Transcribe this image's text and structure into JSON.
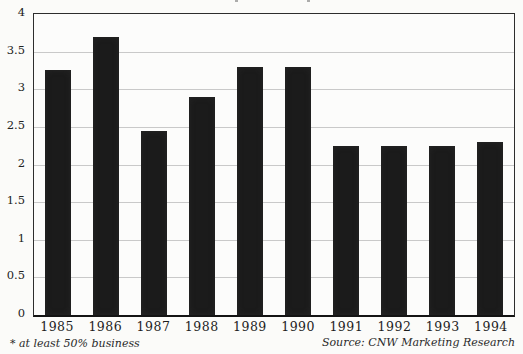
{
  "chart_data": {
    "type": "bar",
    "categories": [
      "1985",
      "1986",
      "1987",
      "1988",
      "1989",
      "1990",
      "1991",
      "1992",
      "1993",
      "1994"
    ],
    "values": [
      3.25,
      3.7,
      2.45,
      2.9,
      3.3,
      3.3,
      2.25,
      2.25,
      2.25,
      2.3
    ],
    "title": "",
    "xlabel": "",
    "ylabel": "",
    "ylim": [
      0,
      4
    ],
    "yticks": [
      0,
      0.5,
      1,
      1.5,
      2,
      2.5,
      3,
      3.5,
      4
    ],
    "ytick_labels": [
      "0",
      "0.5",
      "1",
      "1.5",
      "2",
      "2.5",
      "3",
      "3.5",
      "4"
    ],
    "grid": true,
    "legend": "none",
    "bar_color": "#1b1b1b",
    "gridline_color": "#c9c9c9",
    "frame_color": "#2d2d2d"
  },
  "footnote": "* at least 50% business",
  "source": "Source: CNW Marketing Research"
}
